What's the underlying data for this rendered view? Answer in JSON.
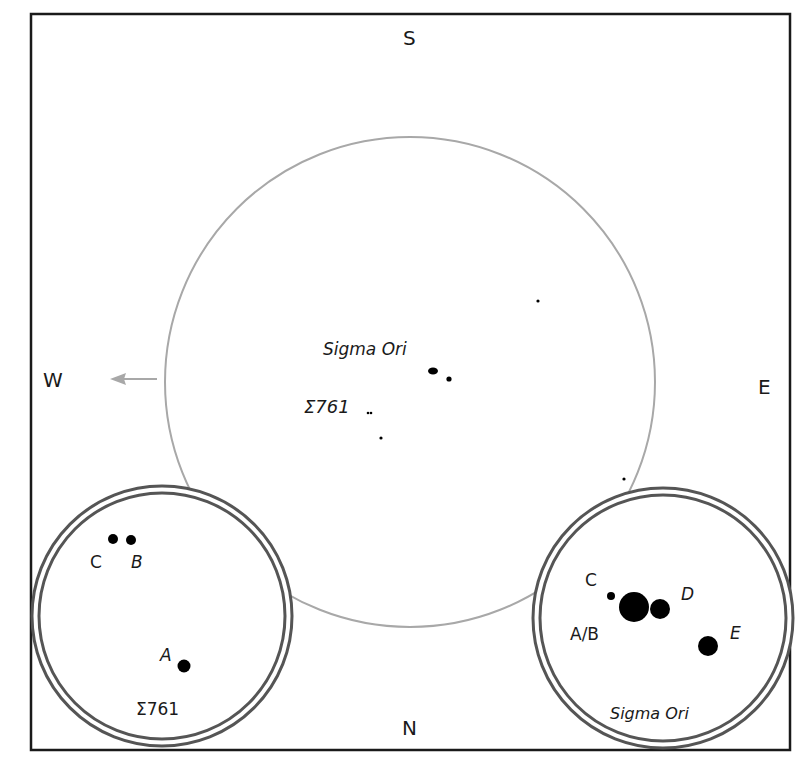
{
  "figure": {
    "frame": {
      "x": 31,
      "y": 14,
      "width": 759,
      "height": 736
    },
    "directions": {
      "south": "S",
      "north": "N",
      "west": "W",
      "east": "E"
    },
    "colors": {
      "frame": "#1a1a1a",
      "field_circle": "#a8a8a8",
      "inset_ring": "#555555",
      "star": "#000000",
      "arrow": "#a8a8a8"
    },
    "main_field": {
      "center": [
        410,
        382
      ],
      "radius": 245,
      "labels": {
        "sigma_ori": "Sigma Ori",
        "struve_761": "Σ761"
      },
      "stars": [
        {
          "name": "Sigma Ori group",
          "x": 433,
          "y": 371,
          "r": 3.5
        },
        {
          "name": "Sigma Ori E",
          "x": 449,
          "y": 379,
          "r": 2.5
        },
        {
          "name": "Σ761 pair",
          "x": 369,
          "y": 413,
          "r": 1.5
        },
        {
          "name": "field star",
          "x": 381,
          "y": 438,
          "r": 1.6
        },
        {
          "name": "field star",
          "x": 538,
          "y": 301,
          "r": 1.6
        },
        {
          "name": "field star",
          "x": 624,
          "y": 479,
          "r": 1.6
        }
      ],
      "west_arrow": {
        "from": [
          157,
          379
        ],
        "to": [
          112,
          379
        ]
      }
    },
    "inset_left": {
      "title": "Σ761",
      "center": [
        162,
        616
      ],
      "radius": 130,
      "stars": [
        {
          "label": "C",
          "x": 113,
          "y": 539,
          "r": 5
        },
        {
          "label": "B",
          "x": 131,
          "y": 540,
          "r": 5
        },
        {
          "label": "A",
          "x": 184,
          "y": 666,
          "r": 6.5
        }
      ],
      "star_labels": [
        {
          "text": "C",
          "x": 97,
          "y": 569
        },
        {
          "text": "B",
          "x": 137,
          "y": 569,
          "italic": true
        },
        {
          "text": "A",
          "x": 167,
          "y": 663,
          "italic": true
        }
      ]
    },
    "inset_right": {
      "title": "Sigma Ori",
      "center": [
        663,
        618
      ],
      "radius": 130,
      "stars": [
        {
          "label": "C",
          "x": 611,
          "y": 596,
          "r": 4
        },
        {
          "label": "A/B",
          "x": 634,
          "y": 607,
          "r": 15
        },
        {
          "label": "D",
          "x": 660,
          "y": 609,
          "r": 10
        },
        {
          "label": "E",
          "x": 708,
          "y": 646,
          "r": 10
        }
      ],
      "star_labels": [
        {
          "text": "C",
          "x": 592,
          "y": 586
        },
        {
          "text": "D",
          "x": 688,
          "y": 601,
          "italic": true
        },
        {
          "text": "A/B",
          "x": 570,
          "y": 638
        },
        {
          "text": "E",
          "x": 736,
          "y": 640,
          "italic": true
        }
      ]
    }
  }
}
